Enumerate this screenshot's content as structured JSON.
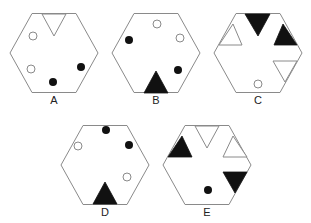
{
  "colors": {
    "outline": "#8a8a8a",
    "black": "#111111",
    "white": "#ffffff"
  },
  "options": [
    {
      "label": "A",
      "cx": 54,
      "cy": 53,
      "label_x": 54,
      "label_y": 94,
      "notches": [
        {
          "fill": "white",
          "points": "42,14 66,14 54,36"
        }
      ],
      "dots": [
        {
          "fill": "white",
          "cx": 33,
          "cy": 36
        },
        {
          "fill": "white",
          "cx": 31,
          "cy": 69
        },
        {
          "fill": "black",
          "cx": 81,
          "cy": 67
        },
        {
          "fill": "black",
          "cx": 53,
          "cy": 82
        }
      ]
    },
    {
      "label": "B",
      "cx": 156,
      "cy": 53,
      "label_x": 156,
      "label_y": 94,
      "notches": [
        {
          "fill": "black",
          "points": "144,93 168,93 156,71"
        }
      ],
      "dots": [
        {
          "fill": "white",
          "cx": 157,
          "cy": 24
        },
        {
          "fill": "black",
          "cx": 129,
          "cy": 40
        },
        {
          "fill": "white",
          "cx": 180,
          "cy": 38
        },
        {
          "fill": "black",
          "cx": 178,
          "cy": 70
        }
      ]
    },
    {
      "label": "C",
      "cx": 258,
      "cy": 53,
      "label_x": 258,
      "label_y": 94,
      "notches": [
        {
          "fill": "black",
          "points": "245,14 270,14 258,36"
        },
        {
          "fill": "black",
          "points": "283,24 297,45 274,45"
        },
        {
          "fill": "white",
          "points": "233,24 219,45 242,45"
        },
        {
          "fill": "white",
          "points": "273,61 297,61 285,82"
        }
      ],
      "dots": [
        {
          "fill": "white",
          "cx": 258,
          "cy": 84
        }
      ]
    },
    {
      "label": "D",
      "cx": 105,
      "cy": 165,
      "label_x": 105,
      "label_y": 206,
      "notches": [
        {
          "fill": "black",
          "points": "93,204 117,204 105,182"
        }
      ],
      "dots": [
        {
          "fill": "black",
          "cx": 106,
          "cy": 130
        },
        {
          "fill": "white",
          "cx": 78,
          "cy": 146
        },
        {
          "fill": "black",
          "cx": 129,
          "cy": 145
        },
        {
          "fill": "white",
          "cx": 127,
          "cy": 177
        }
      ]
    },
    {
      "label": "E",
      "cx": 207,
      "cy": 165,
      "label_x": 207,
      "label_y": 206,
      "notches": [
        {
          "fill": "white",
          "points": "195,126 219,126 207,148"
        },
        {
          "fill": "black",
          "points": "182,136 168,157 192,157"
        },
        {
          "fill": "white",
          "points": "233,136 247,157 223,157"
        },
        {
          "fill": "black",
          "points": "223,172 247,172 235,193"
        }
      ],
      "dots": [
        {
          "fill": "black",
          "cx": 208,
          "cy": 190
        }
      ]
    }
  ]
}
